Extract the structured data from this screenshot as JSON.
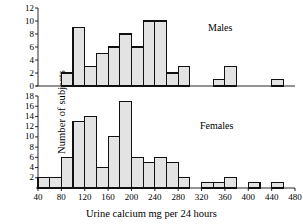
{
  "chart_data": {
    "type": "bar",
    "title": "",
    "xlabel": "Urine calcium mg per 24 hours",
    "ylabel": "Number of subjects",
    "xlim": [
      40,
      480
    ],
    "bin_width": 20,
    "xticks": [
      40,
      80,
      120,
      160,
      200,
      240,
      280,
      320,
      360,
      400,
      440,
      480
    ],
    "grid": false,
    "panels": [
      {
        "name": "Males",
        "ylim": [
          0,
          12
        ],
        "yticks": [
          0,
          2,
          4,
          6,
          8,
          10,
          12
        ],
        "bin_starts": [
          40,
          60,
          80,
          100,
          120,
          140,
          160,
          180,
          200,
          220,
          240,
          260,
          280,
          300,
          320,
          340,
          360,
          380,
          400,
          420,
          440,
          460
        ],
        "values": [
          0,
          0,
          2,
          9,
          3,
          5,
          6,
          8,
          6,
          10,
          10,
          2,
          3,
          0,
          0,
          1,
          3,
          0,
          0,
          0,
          1,
          0
        ]
      },
      {
        "name": "Females",
        "ylim": [
          0,
          18
        ],
        "yticks": [
          2,
          4,
          6,
          8,
          10,
          12,
          14,
          16,
          18
        ],
        "bin_starts": [
          40,
          60,
          80,
          100,
          120,
          140,
          160,
          180,
          200,
          220,
          240,
          260,
          280,
          300,
          320,
          340,
          360,
          380,
          400,
          420,
          440,
          460
        ],
        "values": [
          2,
          2,
          6,
          13,
          14,
          4,
          10,
          17,
          6,
          5,
          6,
          5,
          2,
          0,
          1,
          1,
          2,
          0,
          1,
          0,
          1,
          0
        ]
      }
    ]
  },
  "labels": {
    "males": "Males",
    "females": "Females",
    "xaxis_title": "Urine calcium mg per 24 hours",
    "yaxis_title": "Number of subjects"
  }
}
